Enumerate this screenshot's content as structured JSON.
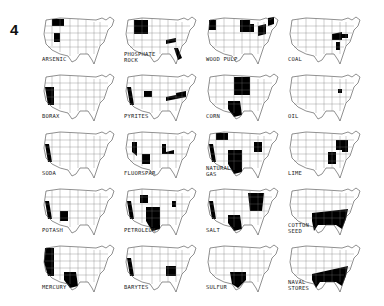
{
  "figure_number": "4",
  "maps": [
    {
      "label": "ARSENIC",
      "regions": [
        "MT",
        "UT"
      ]
    },
    {
      "label": "PHOSPHATE\nROCK",
      "regions": [
        "WY_ID_MT",
        "TN",
        "FL"
      ]
    },
    {
      "label": "WOOD PULP",
      "regions": [
        "WA_OR",
        "MN_WI",
        "MI",
        "NY_PA",
        "ME"
      ]
    },
    {
      "label": "COAL",
      "regions": [
        "KY_WV",
        "VA",
        "AL"
      ]
    },
    {
      "label": "BORAX",
      "regions": [
        "CA_NV"
      ]
    },
    {
      "label": "PYRITES",
      "regions": [
        "CA",
        "CO",
        "TN",
        "VA_NC"
      ]
    },
    {
      "label": "CORN",
      "regions": [
        "MIDWEST",
        "TX"
      ]
    },
    {
      "label": "OIL",
      "regions": [
        "WV_OH"
      ]
    },
    {
      "label": "SODA",
      "regions": [
        "CA"
      ]
    },
    {
      "label": "FLUORSPAR",
      "regions": [
        "NV",
        "NM",
        "IL_KY"
      ]
    },
    {
      "label": "NATURAL\nGAS",
      "regions": [
        "MT",
        "CA",
        "TX_OK_KS",
        "WV_PA"
      ]
    },
    {
      "label": "LIME",
      "regions": [
        "PA_NY",
        "TN_AL",
        "VA"
      ]
    },
    {
      "label": "POTASH",
      "regions": [
        "CA",
        "NM"
      ]
    },
    {
      "label": "PETROLEUM",
      "regions": [
        "CA",
        "WY",
        "TX_OK_KS",
        "OH"
      ]
    },
    {
      "label": "SALT",
      "regions": [
        "CA",
        "TX",
        "MI_NY_OH"
      ]
    },
    {
      "label": "COTTON\nSEED",
      "regions": [
        "SOUTH"
      ]
    },
    {
      "label": "MERCURY",
      "regions": [
        "CA_OR_NV",
        "TX"
      ]
    },
    {
      "label": "BARYTES",
      "regions": [
        "CA",
        "GA_TN"
      ]
    },
    {
      "label": "SULFUR",
      "regions": [
        "TX_LA"
      ]
    },
    {
      "label": "NAVAL\nSTORES",
      "regions": [
        "GULF_SE"
      ]
    }
  ]
}
